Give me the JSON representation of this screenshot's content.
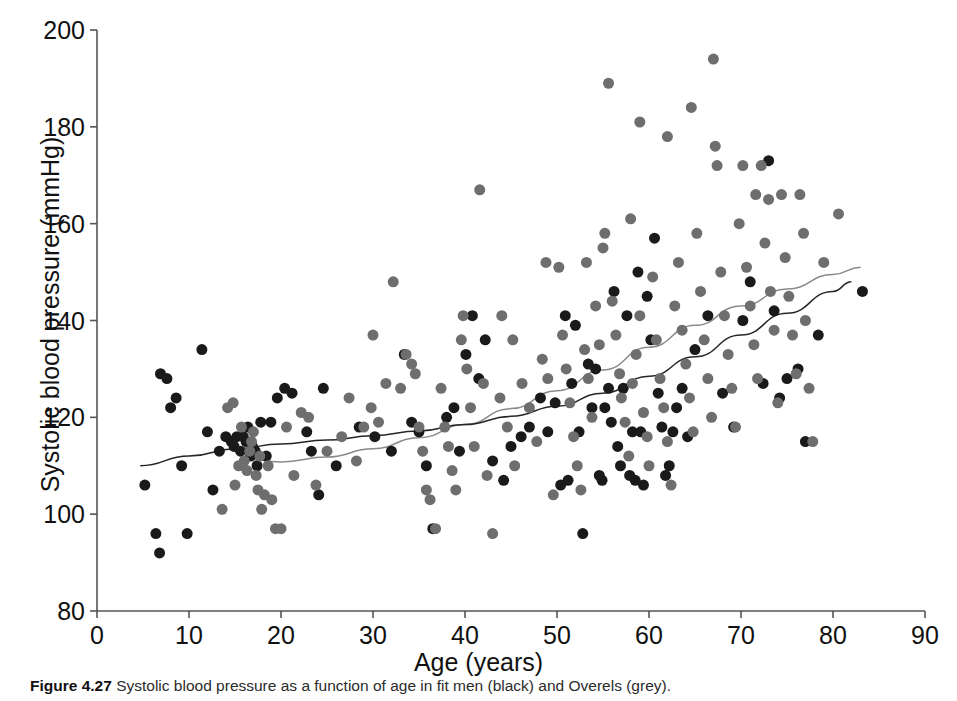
{
  "figure": {
    "caption_label": "Figure 4.27",
    "caption_text": "Systolic blood pressure as a function of age in fit men (black) and Overels (grey)."
  },
  "axes": {
    "x_title": "Age (years)",
    "y_title": "Systolic blood pressure (mmHg)",
    "x_ticks": [
      "0",
      "10",
      "20",
      "30",
      "40",
      "50",
      "60",
      "70",
      "80",
      "90"
    ],
    "y_ticks": [
      "80",
      "100",
      "120",
      "140",
      "160",
      "180",
      "200"
    ]
  },
  "colors": {
    "series_black": "#1a1a1a",
    "series_grey": "#6e6e6e",
    "curve_black": "#262626",
    "curve_grey": "#8a8a8a",
    "axis": "#555555",
    "background": "#ffffff"
  },
  "chart_data": {
    "type": "scatter",
    "title": "",
    "xlabel": "Age (years)",
    "ylabel": "Systolic blood pressure (mmHg)",
    "xlim": [
      0,
      90
    ],
    "ylim": [
      80,
      200
    ],
    "x_tick_step": 10,
    "y_tick_step": 20,
    "grid": false,
    "legend": "none",
    "marker_size_px": 11,
    "series": [
      {
        "name": "fit men (black)",
        "color": "#1a1a1a",
        "points": [
          [
            5.2,
            106
          ],
          [
            6.4,
            96
          ],
          [
            6.8,
            92
          ],
          [
            6.9,
            129
          ],
          [
            7.6,
            128
          ],
          [
            8.0,
            122
          ],
          [
            8.6,
            124
          ],
          [
            9.2,
            110
          ],
          [
            9.8,
            96
          ],
          [
            11.4,
            134
          ],
          [
            12.0,
            117
          ],
          [
            12.6,
            105
          ],
          [
            13.3,
            113
          ],
          [
            14.0,
            116
          ],
          [
            14.6,
            115
          ],
          [
            14.9,
            114
          ],
          [
            15.2,
            116
          ],
          [
            15.6,
            113
          ],
          [
            15.9,
            116
          ],
          [
            16.2,
            115
          ],
          [
            16.4,
            118
          ],
          [
            16.7,
            112
          ],
          [
            16.9,
            114
          ],
          [
            17.2,
            113
          ],
          [
            17.4,
            110
          ],
          [
            17.8,
            119
          ],
          [
            18.4,
            112
          ],
          [
            18.9,
            119
          ],
          [
            19.6,
            124
          ],
          [
            20.4,
            126
          ],
          [
            21.2,
            125
          ],
          [
            22.8,
            117
          ],
          [
            23.3,
            113
          ],
          [
            24.1,
            104
          ],
          [
            24.6,
            126
          ],
          [
            26.0,
            110
          ],
          [
            28.5,
            118
          ],
          [
            30.2,
            116
          ],
          [
            32.0,
            113
          ],
          [
            33.4,
            133
          ],
          [
            34.2,
            119
          ],
          [
            35.0,
            117
          ],
          [
            35.8,
            110
          ],
          [
            36.5,
            97
          ],
          [
            38.0,
            120
          ],
          [
            38.8,
            122
          ],
          [
            39.4,
            113
          ],
          [
            40.1,
            133
          ],
          [
            40.8,
            141
          ],
          [
            41.5,
            128
          ],
          [
            42.2,
            136
          ],
          [
            43.0,
            111
          ],
          [
            44.2,
            107
          ],
          [
            45.0,
            114
          ],
          [
            46.1,
            116
          ],
          [
            47.0,
            118
          ],
          [
            48.2,
            124
          ],
          [
            49.0,
            117
          ],
          [
            49.8,
            123
          ],
          [
            50.4,
            106
          ],
          [
            50.9,
            141
          ],
          [
            51.2,
            107
          ],
          [
            51.6,
            127
          ],
          [
            52.0,
            139
          ],
          [
            52.4,
            117
          ],
          [
            52.8,
            96
          ],
          [
            53.4,
            131
          ],
          [
            53.8,
            122
          ],
          [
            54.2,
            130
          ],
          [
            54.6,
            108
          ],
          [
            54.9,
            107
          ],
          [
            55.2,
            122
          ],
          [
            55.6,
            126
          ],
          [
            55.9,
            119
          ],
          [
            56.2,
            146
          ],
          [
            56.6,
            114
          ],
          [
            56.9,
            110
          ],
          [
            57.2,
            126
          ],
          [
            57.6,
            141
          ],
          [
            57.9,
            108
          ],
          [
            58.2,
            117
          ],
          [
            58.5,
            107
          ],
          [
            58.8,
            150
          ],
          [
            59.1,
            117
          ],
          [
            59.4,
            106
          ],
          [
            59.8,
            145
          ],
          [
            60.2,
            136
          ],
          [
            60.6,
            157
          ],
          [
            61.0,
            125
          ],
          [
            61.4,
            118
          ],
          [
            61.8,
            108
          ],
          [
            62.2,
            110
          ],
          [
            62.6,
            117
          ],
          [
            63.0,
            122
          ],
          [
            63.6,
            126
          ],
          [
            64.2,
            116
          ],
          [
            65.0,
            134
          ],
          [
            66.4,
            141
          ],
          [
            68.0,
            125
          ],
          [
            69.2,
            118
          ],
          [
            70.2,
            140
          ],
          [
            71.0,
            148
          ],
          [
            72.4,
            127
          ],
          [
            73.0,
            173
          ],
          [
            73.6,
            142
          ],
          [
            74.2,
            124
          ],
          [
            75.0,
            128
          ],
          [
            76.2,
            130
          ],
          [
            77.0,
            115
          ],
          [
            78.4,
            137
          ],
          [
            83.2,
            146
          ]
        ]
      },
      {
        "name": "Overels (grey)",
        "color": "#6e6e6e",
        "points": [
          [
            13.6,
            101
          ],
          [
            14.2,
            122
          ],
          [
            14.8,
            123
          ],
          [
            15.0,
            106
          ],
          [
            15.4,
            110
          ],
          [
            15.7,
            118
          ],
          [
            16.0,
            111
          ],
          [
            16.3,
            109
          ],
          [
            16.6,
            113
          ],
          [
            16.8,
            115
          ],
          [
            17.0,
            117
          ],
          [
            17.3,
            108
          ],
          [
            17.5,
            105
          ],
          [
            17.7,
            112
          ],
          [
            17.9,
            101
          ],
          [
            18.2,
            104
          ],
          [
            18.6,
            110
          ],
          [
            19.0,
            103
          ],
          [
            19.4,
            97
          ],
          [
            20.0,
            97
          ],
          [
            20.6,
            118
          ],
          [
            21.4,
            108
          ],
          [
            22.2,
            121
          ],
          [
            23.0,
            120
          ],
          [
            23.8,
            106
          ],
          [
            25.0,
            113
          ],
          [
            26.6,
            116
          ],
          [
            27.4,
            124
          ],
          [
            28.2,
            111
          ],
          [
            29.0,
            118
          ],
          [
            29.8,
            122
          ],
          [
            30.6,
            119
          ],
          [
            31.4,
            127
          ],
          [
            32.2,
            148
          ],
          [
            33.0,
            126
          ],
          [
            33.6,
            133
          ],
          [
            34.2,
            131
          ],
          [
            34.6,
            129
          ],
          [
            35.0,
            118
          ],
          [
            35.4,
            113
          ],
          [
            35.8,
            105
          ],
          [
            36.2,
            103
          ],
          [
            36.8,
            97
          ],
          [
            37.4,
            126
          ],
          [
            37.8,
            118
          ],
          [
            38.2,
            114
          ],
          [
            38.6,
            109
          ],
          [
            39.0,
            105
          ],
          [
            39.6,
            136
          ],
          [
            40.2,
            130
          ],
          [
            40.6,
            122
          ],
          [
            41.0,
            114
          ],
          [
            41.6,
            167
          ],
          [
            42.0,
            127
          ],
          [
            42.4,
            108
          ],
          [
            43.0,
            96
          ],
          [
            43.8,
            124
          ],
          [
            44.6,
            118
          ],
          [
            45.4,
            110
          ],
          [
            46.2,
            127
          ],
          [
            47.0,
            122
          ],
          [
            47.8,
            115
          ],
          [
            48.4,
            132
          ],
          [
            49.0,
            128
          ],
          [
            49.6,
            104
          ],
          [
            50.2,
            151
          ],
          [
            50.6,
            137
          ],
          [
            51.0,
            130
          ],
          [
            51.4,
            123
          ],
          [
            51.8,
            116
          ],
          [
            52.2,
            110
          ],
          [
            52.6,
            105
          ],
          [
            53.0,
            134
          ],
          [
            53.4,
            128
          ],
          [
            53.8,
            120
          ],
          [
            54.2,
            143
          ],
          [
            54.6,
            135
          ],
          [
            55.0,
            155
          ],
          [
            55.2,
            158
          ],
          [
            55.6,
            189
          ],
          [
            56.0,
            144
          ],
          [
            56.4,
            137
          ],
          [
            56.8,
            129
          ],
          [
            57.0,
            124
          ],
          [
            57.4,
            119
          ],
          [
            57.8,
            112
          ],
          [
            58.2,
            127
          ],
          [
            58.6,
            133
          ],
          [
            59.0,
            141
          ],
          [
            59.4,
            121
          ],
          [
            59.8,
            116
          ],
          [
            60.0,
            110
          ],
          [
            60.4,
            149
          ],
          [
            60.8,
            136
          ],
          [
            61.2,
            128
          ],
          [
            61.6,
            122
          ],
          [
            62.0,
            115
          ],
          [
            62.4,
            106
          ],
          [
            62.8,
            143
          ],
          [
            63.2,
            152
          ],
          [
            63.6,
            138
          ],
          [
            64.0,
            131
          ],
          [
            64.4,
            124
          ],
          [
            64.8,
            117
          ],
          [
            65.2,
            158
          ],
          [
            65.6,
            146
          ],
          [
            66.0,
            136
          ],
          [
            66.4,
            128
          ],
          [
            66.8,
            120
          ],
          [
            67.0,
            194
          ],
          [
            67.4,
            172
          ],
          [
            67.8,
            150
          ],
          [
            68.2,
            141
          ],
          [
            68.6,
            133
          ],
          [
            69.0,
            126
          ],
          [
            69.4,
            118
          ],
          [
            69.8,
            160
          ],
          [
            70.2,
            172
          ],
          [
            70.6,
            151
          ],
          [
            71.0,
            143
          ],
          [
            71.4,
            135
          ],
          [
            71.8,
            128
          ],
          [
            72.2,
            172
          ],
          [
            72.6,
            156
          ],
          [
            73.0,
            165
          ],
          [
            73.2,
            146
          ],
          [
            73.6,
            138
          ],
          [
            74.0,
            123
          ],
          [
            74.4,
            166
          ],
          [
            74.8,
            153
          ],
          [
            75.2,
            145
          ],
          [
            75.6,
            137
          ],
          [
            76.0,
            129
          ],
          [
            76.4,
            166
          ],
          [
            76.8,
            158
          ],
          [
            77.0,
            140
          ],
          [
            77.4,
            126
          ],
          [
            77.8,
            115
          ],
          [
            79.0,
            152
          ],
          [
            80.6,
            162
          ],
          [
            64.6,
            184
          ],
          [
            62.0,
            178
          ],
          [
            67.2,
            176
          ],
          [
            59.0,
            181
          ],
          [
            71.6,
            166
          ],
          [
            58.0,
            161
          ],
          [
            44.0,
            141
          ],
          [
            48.8,
            152
          ],
          [
            53.2,
            152
          ],
          [
            45.2,
            136
          ],
          [
            39.8,
            141
          ],
          [
            30.0,
            137
          ]
        ]
      }
    ],
    "fit_curves": [
      {
        "name": "grey fit (Overels)",
        "color": "#8a8a8a",
        "x_range": [
          16,
          83
        ],
        "points": [
          [
            16,
            111.5
          ],
          [
            20,
            110.8
          ],
          [
            25,
            111.8
          ],
          [
            30,
            113.5
          ],
          [
            35,
            115.8
          ],
          [
            40,
            118.5
          ],
          [
            45,
            121.8
          ],
          [
            50,
            125.5
          ],
          [
            55,
            129.8
          ],
          [
            60,
            134.5
          ],
          [
            65,
            139.0
          ],
          [
            70,
            143.0
          ],
          [
            75,
            146.5
          ],
          [
            80,
            149.5
          ],
          [
            83,
            151.0
          ]
        ]
      },
      {
        "name": "black fit (fit men)",
        "color": "#262626",
        "x_range": [
          4.7,
          82
        ],
        "points": [
          [
            4.7,
            110.0
          ],
          [
            10,
            112.0
          ],
          [
            15,
            113.5
          ],
          [
            20,
            114.5
          ],
          [
            25,
            115.3
          ],
          [
            30,
            116.2
          ],
          [
            35,
            117.2
          ],
          [
            40,
            118.5
          ],
          [
            45,
            120.2
          ],
          [
            50,
            122.3
          ],
          [
            55,
            125.0
          ],
          [
            60,
            128.5
          ],
          [
            65,
            132.5
          ],
          [
            70,
            137.0
          ],
          [
            75,
            141.5
          ],
          [
            80,
            146.0
          ],
          [
            82,
            148.0
          ]
        ]
      }
    ]
  }
}
